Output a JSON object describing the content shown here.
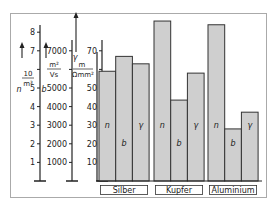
{
  "chart_data": {
    "type": "bar",
    "title": "",
    "categories": [
      "Silber",
      "Kupfer",
      "Aluminium"
    ],
    "series": [
      {
        "name": "n",
        "symbol": "n",
        "unit": "10/m³",
        "values": [
          5.9,
          8.6,
          8.4
        ]
      },
      {
        "name": "b",
        "symbol": "b",
        "unit": "m²/Vs",
        "values": [
          6700,
          4350,
          2800
        ]
      },
      {
        "name": "γ",
        "symbol": "γ",
        "unit": "m/(Ω·mm²)",
        "values": [
          63,
          58,
          37
        ]
      }
    ],
    "axes": [
      {
        "symbol": "n",
        "unit_num": "10",
        "unit_den": "m³",
        "ticks": [
          "1",
          "2",
          "3",
          "4",
          "5",
          "6",
          "7",
          "8"
        ],
        "ylim": [
          0,
          8.5
        ]
      },
      {
        "symbol": "b",
        "unit_num": "m²",
        "unit_den": "Vs",
        "ticks": [
          "1000",
          "2000",
          "3000",
          "4000",
          "5000",
          "6000",
          "7000"
        ],
        "ylim": [
          0,
          8500
        ]
      },
      {
        "symbol": "γ",
        "unit_num": "m",
        "unit_den": "Ωmm²",
        "ticks": [
          "10",
          "20",
          "30",
          "40",
          "50",
          "60",
          "70"
        ],
        "ylim": [
          0,
          85
        ]
      }
    ],
    "grid": false,
    "legend": "labels inside bars"
  },
  "colors": {
    "bar_fill": "#cfcfcf",
    "bar_stroke": "#333333",
    "frame": "#aaaaaa"
  }
}
